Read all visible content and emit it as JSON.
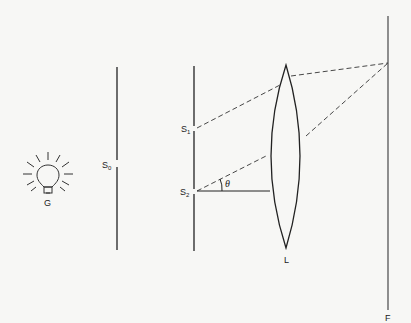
{
  "diagram": {
    "type": "optics-double-slit-with-lens",
    "labels": {
      "source": "G",
      "primary_slit": "S",
      "primary_slit_sub": "0",
      "slit1": "S",
      "slit1_sub": "1",
      "slit2": "S",
      "slit2_sub": "2",
      "angle": "θ",
      "lens": "L",
      "screen": "F"
    },
    "elements": [
      {
        "id": "G",
        "kind": "light-bulb"
      },
      {
        "id": "S0",
        "kind": "single-slit screen"
      },
      {
        "id": "S1-S2",
        "kind": "double-slit screen"
      },
      {
        "id": "L",
        "kind": "converging lens"
      },
      {
        "id": "F",
        "kind": "focal-plane screen"
      }
    ],
    "colors": {
      "line": "#222222",
      "background": "#f7f7f5"
    }
  }
}
